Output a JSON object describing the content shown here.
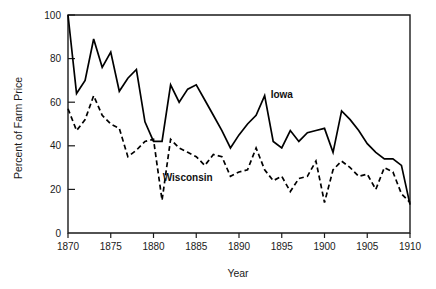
{
  "figure": {
    "background_color": "#ffffff",
    "line_color": "#000000",
    "axis_color": "#1a1a1a"
  },
  "axes": {
    "x_title": "Year",
    "y_title": "Percent of Farm Price",
    "x_ticks": [
      "1870",
      "1875",
      "1880",
      "1885",
      "1890",
      "1895",
      "1900",
      "1905",
      "1910"
    ],
    "y_ticks": [
      "0",
      "20",
      "40",
      "60",
      "80",
      "100"
    ]
  },
  "labels": {
    "iowa": "Iowa",
    "wisconsin": "Wisconsin"
  },
  "chart_data": {
    "type": "line",
    "title": "",
    "xlabel": "Year",
    "ylabel": "Percent of Farm Price",
    "xlim": [
      1870,
      1910
    ],
    "ylim": [
      0,
      100
    ],
    "xticks": [
      1870,
      1875,
      1880,
      1885,
      1890,
      1895,
      1900,
      1905,
      1910
    ],
    "yticks": [
      0,
      20,
      40,
      60,
      80,
      100
    ],
    "grid": false,
    "legend": "inline-annotations",
    "x": [
      1870,
      1871,
      1872,
      1873,
      1874,
      1875,
      1876,
      1877,
      1878,
      1879,
      1880,
      1881,
      1882,
      1883,
      1884,
      1885,
      1886,
      1887,
      1888,
      1889,
      1890,
      1891,
      1892,
      1893,
      1894,
      1895,
      1896,
      1897,
      1898,
      1899,
      1900,
      1901,
      1902,
      1903,
      1904,
      1905,
      1906,
      1907,
      1908,
      1909,
      1910
    ],
    "series": [
      {
        "name": "Iowa",
        "style": "solid",
        "label_x": 1895,
        "label_y": 62,
        "values": [
          100,
          64,
          70,
          89,
          76,
          83,
          65,
          71,
          75,
          51,
          42,
          42,
          68,
          60,
          66,
          68,
          61,
          54,
          47,
          39,
          45,
          50,
          54,
          63,
          42,
          39,
          47,
          42,
          46,
          47,
          48,
          37,
          56,
          52,
          47,
          41,
          37,
          34,
          34,
          31,
          13
        ]
      },
      {
        "name": "Wisconsin",
        "style": "dashed",
        "label_x": 1884,
        "label_y": 24,
        "values": [
          57,
          47,
          52,
          63,
          54,
          50,
          48,
          35,
          38,
          42,
          43,
          15,
          43,
          39,
          37,
          35,
          31,
          36,
          35,
          26,
          28,
          29,
          39,
          29,
          24,
          26,
          19,
          25,
          26,
          33,
          14,
          29,
          33,
          30,
          26,
          27,
          20,
          30,
          28,
          18,
          14
        ]
      }
    ]
  }
}
